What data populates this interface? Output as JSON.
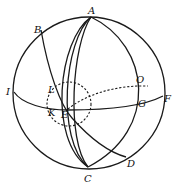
{
  "diagram": {
    "type": "spherical-geometry",
    "stroke_color": "#1a1a1a",
    "background": "#ffffff",
    "points": {
      "A": {
        "label": "A",
        "x": 91,
        "y": 14
      },
      "B": {
        "label": "B",
        "x": 36,
        "y": 30
      },
      "I": {
        "label": "I",
        "x": 7,
        "y": 94
      },
      "L": {
        "label": "L",
        "x": 48,
        "y": 91
      },
      "K": {
        "label": "K",
        "x": 47,
        "y": 115
      },
      "E": {
        "label": "E",
        "x": 60,
        "y": 119
      },
      "O": {
        "label": "O",
        "x": 137,
        "y": 83
      },
      "G": {
        "label": "G",
        "x": 139,
        "y": 106
      },
      "F": {
        "label": "F",
        "x": 165,
        "y": 102
      },
      "D": {
        "label": "D",
        "x": 127,
        "y": 168
      },
      "C": {
        "label": "C",
        "x": 85,
        "y": 183
      }
    },
    "edges": [
      "outer-circle",
      "meridian A-C (left outer)",
      "meridian A-C (left middle)",
      "meridian A-C (left inner)",
      "meridian A-C (right)",
      "arc B-L-E-D",
      "equator I-K-E-G-F",
      "dashed arc E-O",
      "dashed O-G segment",
      "dashed small circle about E"
    ]
  }
}
